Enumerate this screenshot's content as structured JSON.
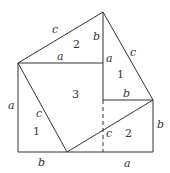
{
  "diagram": {
    "line_color": "#333333",
    "labels": {
      "top_hyp_left": "c",
      "top_tri_num": "2",
      "top_vertical_b": "b",
      "top_horizontal_a": "a",
      "right_a": "a",
      "right_hyp": "c",
      "right_tri_num": "1",
      "center_square_num": "3",
      "inner_b": "b",
      "left_side_a": "a",
      "left_hyp": "c",
      "left_tri_num": "1",
      "bottom_b": "b",
      "bottom_hyp": "c",
      "bottom_right_num": "2",
      "right_side_b": "b",
      "bottom_a": "a"
    }
  }
}
